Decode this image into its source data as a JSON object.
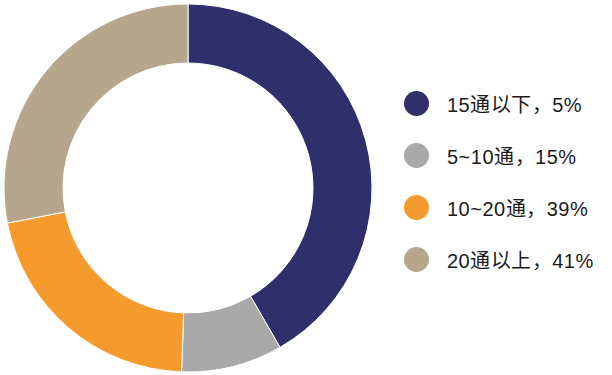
{
  "chart_data": {
    "type": "pie",
    "variant": "donut",
    "title": "",
    "subtitle": "",
    "xlabel": "",
    "ylabel": "",
    "grid": false,
    "legend_position": "right",
    "start_angle_deg": 0,
    "direction": "clockwise",
    "center": {
      "x": 188,
      "y": 188
    },
    "outer_radius": 184,
    "inner_radius": 125,
    "categories": [
      "15通以下",
      "5~10通",
      "10~20通",
      "20通以上"
    ],
    "values": [
      5,
      15,
      39,
      41
    ],
    "value_unit": "%",
    "colors": [
      "#2e2f6b",
      "#a9a9a9",
      "#f59b2e",
      "#b5a68c"
    ],
    "drawn_sweep_deg": [
      150,
      32,
      77,
      101
    ],
    "data_labels": [
      "5%",
      "15%",
      "39%",
      "41%"
    ],
    "slices": [
      {
        "name": "15通以下",
        "value": 5,
        "label": "15通以下，5%",
        "color": "#2e2f6b",
        "start_deg": 0,
        "end_deg": 150
      },
      {
        "name": "5~10通",
        "value": 15,
        "label": "5~10通，15%",
        "color": "#a9a9a9",
        "start_deg": 150,
        "end_deg": 182
      },
      {
        "name": "10~20通",
        "value": 39,
        "label": "10~20通，39%",
        "color": "#f59b2e",
        "start_deg": 182,
        "end_deg": 259
      },
      {
        "name": "20通以上",
        "value": 41,
        "label": "20通以上，41%",
        "color": "#b5a68c",
        "start_deg": 259,
        "end_deg": 360
      }
    ]
  },
  "legend": {
    "items": [
      {
        "marker_name": "legend-swatch-navy",
        "label": "15通以下，5%",
        "color": "#2e2f6b"
      },
      {
        "marker_name": "legend-swatch-gray",
        "label": "5~10通，15%",
        "color": "#a9a9a9"
      },
      {
        "marker_name": "legend-swatch-orange",
        "label": "10~20通，39%",
        "color": "#f59b2e"
      },
      {
        "marker_name": "legend-swatch-tan",
        "label": "20通以上，41%",
        "color": "#b5a68c"
      }
    ]
  }
}
